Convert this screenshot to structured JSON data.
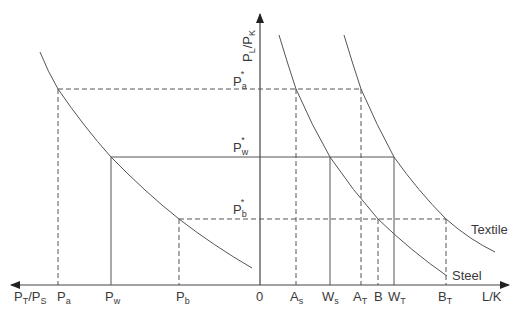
{
  "diagram": {
    "colors": {
      "line": "#555555",
      "text": "#3a3a3a",
      "background": "#ffffff"
    },
    "axes": {
      "y_label": {
        "main": "P",
        "sub1": "L",
        "slash": "/P",
        "sub2": "K"
      },
      "x_right_label": "L/K",
      "x_left_label": {
        "p1": "P",
        "s1": "T",
        "slash": "/P",
        "s2": "S"
      },
      "origin": "0"
    },
    "y_ticks": [
      {
        "main": "P",
        "sub": "a",
        "sup": "*"
      },
      {
        "main": "P",
        "sub": "w",
        "sup": "*"
      },
      {
        "main": "P",
        "sub": "b",
        "sup": "*"
      }
    ],
    "x_left_ticks": [
      {
        "main": "P",
        "sub": "a"
      },
      {
        "main": "P",
        "sub": "w"
      },
      {
        "main": "P",
        "sub": "b"
      }
    ],
    "x_right_ticks": [
      {
        "main": "A",
        "sub": "s"
      },
      {
        "main": "W",
        "sub": "s"
      },
      {
        "main": "A",
        "sub": "T"
      },
      {
        "main": "B",
        "sub": ""
      },
      {
        "main": "W",
        "sub": "T"
      },
      {
        "main": "B",
        "sub": "T"
      }
    ],
    "curves": {
      "steel_label": "Steel",
      "textile_label": "Textile"
    }
  }
}
